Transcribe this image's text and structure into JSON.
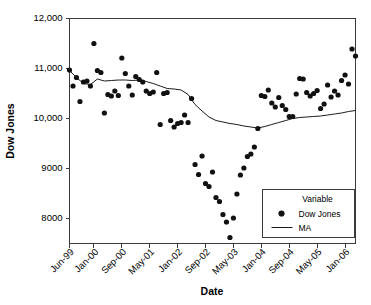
{
  "chart_data": {
    "type": "scatter",
    "title": "",
    "xlabel": "Date",
    "ylabel": "Dow Jones",
    "legend_title": "Variable",
    "legend_position": "inside-bottom-right",
    "grid": false,
    "ylim": [
      7500,
      12000
    ],
    "yticks": [
      8000,
      9000,
      10000,
      11000,
      12000
    ],
    "ytick_labels": [
      "8000",
      "9000",
      "10,000",
      "11,000",
      "12,000"
    ],
    "xtick_labels": [
      "Jun-99",
      "Jan-00",
      "Sep-00",
      "May-01",
      "Jan-02",
      "Sep-02",
      "May-03",
      "Jan-04",
      "Sep-04",
      "May-05",
      "Jan-06"
    ],
    "xlim_months": [
      0,
      82
    ],
    "xtick_months": [
      0,
      7,
      15,
      23,
      31,
      39,
      47,
      55,
      63,
      71,
      79
    ],
    "series": [
      {
        "name": "Dow Jones",
        "type": "scatter",
        "marker": "filled-circle",
        "color": "#111111",
        "x": [
          0,
          1,
          2,
          3,
          4,
          5,
          6,
          7,
          8,
          9,
          10,
          11,
          12,
          13,
          14,
          15,
          16,
          17,
          18,
          19,
          20,
          21,
          22,
          23,
          24,
          25,
          26,
          27,
          28,
          29,
          30,
          31,
          32,
          33,
          34,
          35,
          36,
          37,
          38,
          39,
          40,
          41,
          42,
          43,
          44,
          45,
          46,
          47,
          48,
          49,
          50,
          51,
          52,
          53,
          54,
          55,
          56,
          57,
          58,
          59,
          60,
          61,
          62,
          63,
          64,
          65,
          66,
          67,
          68,
          69,
          70,
          71,
          72,
          73,
          74,
          75,
          76,
          77,
          78,
          79,
          80,
          81,
          82
        ],
        "y": [
          10970,
          10650,
          10820,
          10340,
          10730,
          10750,
          10650,
          11500,
          10960,
          10920,
          10110,
          10480,
          10450,
          10550,
          10460,
          11210,
          10900,
          10650,
          10470,
          10840,
          10780,
          10730,
          10550,
          10500,
          10530,
          10920,
          9880,
          10500,
          10520,
          9960,
          9830,
          9900,
          9920,
          10070,
          9920,
          10400,
          9080,
          8880,
          9250,
          8700,
          8640,
          8930,
          8420,
          8340,
          8080,
          7930,
          7620,
          8010,
          8490,
          8870,
          9010,
          9240,
          9290,
          9430,
          9800,
          10460,
          10440,
          10570,
          10310,
          10230,
          10420,
          10260,
          10180,
          10040,
          10040,
          10490,
          10800,
          10790,
          10520,
          10450,
          10500,
          10560,
          10200,
          10290,
          10670,
          10430,
          10550,
          10470,
          10760,
          10870,
          10690,
          11390,
          11250
        ]
      },
      {
        "name": "MA",
        "type": "line",
        "color": "#1c1c1c",
        "x": [
          0,
          2,
          4,
          6,
          8,
          10,
          12,
          14,
          16,
          18,
          20,
          22,
          24,
          26,
          28,
          30,
          32,
          34,
          36,
          38,
          40,
          42,
          44,
          46,
          48,
          50,
          52,
          54,
          56,
          58,
          60,
          62,
          64,
          66,
          68,
          70,
          72,
          74,
          76,
          78,
          80,
          82
        ],
        "y": [
          10960,
          10820,
          10700,
          10680,
          10790,
          10750,
          10760,
          10770,
          10770,
          10760,
          10770,
          10740,
          10700,
          10650,
          10600,
          10590,
          10570,
          10480,
          10280,
          10150,
          10030,
          9960,
          9930,
          9900,
          9880,
          9850,
          9830,
          9810,
          9840,
          9880,
          9920,
          9960,
          10000,
          10020,
          10030,
          10040,
          10050,
          10070,
          10090,
          10110,
          10140,
          10160
        ]
      }
    ]
  },
  "legend": {
    "title": "Variable",
    "items": [
      {
        "label": "Dow Jones",
        "marker": "dot"
      },
      {
        "label": "MA",
        "marker": "line"
      }
    ]
  }
}
